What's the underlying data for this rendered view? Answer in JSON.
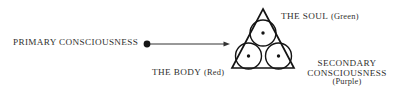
{
  "diagram": {
    "title_text_color": "#30302e",
    "background": "#ffffff",
    "stroke_color": "#1a1a1a",
    "labels": {
      "primary_consciousness": "PRIMARY CONSCIOUSNESS",
      "soul_caps": "THE SOUL",
      "soul_paren": "(Green)",
      "body_caps": "THE BODY",
      "body_paren": "(Red)",
      "secondary_line1": "SECONDARY",
      "secondary_line2": "CONSCIOUSNESS",
      "secondary_paren": "(Purple)"
    },
    "shapes": {
      "triangle": {
        "apex_x": 263,
        "apex_y": 9,
        "left_x": 232,
        "right_x": 294,
        "base_y": 68
      },
      "circles": [
        {
          "name": "soul-circle",
          "cx": 263,
          "cy": 33,
          "r": 13
        },
        {
          "name": "body-circle",
          "cx": 248.5,
          "cy": 56,
          "r": 13
        },
        {
          "name": "secondary-consciousness-circle",
          "cx": 278.5,
          "cy": 56,
          "r": 13
        }
      ],
      "center_dots": [
        {
          "cx": 263,
          "cy": 33,
          "r": 1.6
        },
        {
          "cx": 248.5,
          "cy": 56,
          "r": 1.6
        },
        {
          "cx": 278.5,
          "cy": 56,
          "r": 1.6
        }
      ],
      "arrow": {
        "origin_dot_cx": 147,
        "origin_dot_cy": 44,
        "origin_dot_r": 3.4,
        "line_start_x": 150,
        "line_end_x": 226,
        "line_y": 44,
        "head_tip_x": 230
      }
    }
  }
}
